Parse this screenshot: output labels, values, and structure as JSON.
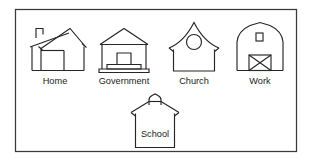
{
  "figure": {
    "background_color": "#ffffff",
    "frame": {
      "name": "outer-border",
      "x": 15,
      "y": 9,
      "width": 282,
      "height": 143,
      "stroke_color": "#3a3a3a"
    },
    "stroke_color": "#262626",
    "label_color": "#1a1a1a",
    "rows": [
      {
        "name": "top-row",
        "items": [
          {
            "id": "home",
            "label": "Home",
            "icon": "house-icon",
            "label_x": 55,
            "label_y": 84
          },
          {
            "id": "government",
            "label": "Government",
            "icon": "government-hall-icon",
            "label_x": 124,
            "label_y": 84
          },
          {
            "id": "church",
            "label": "Church",
            "icon": "church-icon",
            "label_x": 194,
            "label_y": 84
          },
          {
            "id": "work",
            "label": "Work",
            "icon": "barn-icon",
            "label_x": 260,
            "label_y": 84
          }
        ]
      },
      {
        "name": "bottom-row",
        "items": [
          {
            "id": "school",
            "label": "School",
            "icon": "schoolhouse-icon",
            "label_x": 155,
            "label_y": 137
          }
        ]
      }
    ]
  }
}
